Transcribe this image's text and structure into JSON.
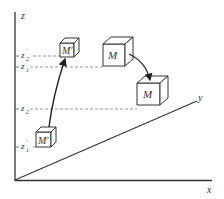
{
  "diagram": {
    "axes": {
      "z_label": "z",
      "y_label": "y",
      "x_label": "x"
    },
    "levels": [
      {
        "id": "z2_prime",
        "label": "z",
        "sub": "2",
        "prime": "′"
      },
      {
        "id": "z1",
        "label": "z",
        "sub": "1",
        "prime": ""
      },
      {
        "id": "z2",
        "label": "z",
        "sub": "2",
        "prime": ""
      },
      {
        "id": "z1_prime",
        "label": "z",
        "sub": "1",
        "prime": "′"
      }
    ],
    "cubes": [
      {
        "id": "cube-m-prime-top",
        "label": "M′"
      },
      {
        "id": "cube-m-top",
        "label": "M"
      },
      {
        "id": "cube-m-bottom",
        "label": "M"
      },
      {
        "id": "cube-m-prime-bottom",
        "label": "M′"
      }
    ],
    "arrows": [
      {
        "id": "arrow-m-prime",
        "from": "z1′",
        "to": "z2′"
      },
      {
        "id": "arrow-m",
        "from": "z1",
        "to": "z2"
      }
    ],
    "colors": {
      "line": "#333333",
      "dash": "#777777"
    }
  }
}
